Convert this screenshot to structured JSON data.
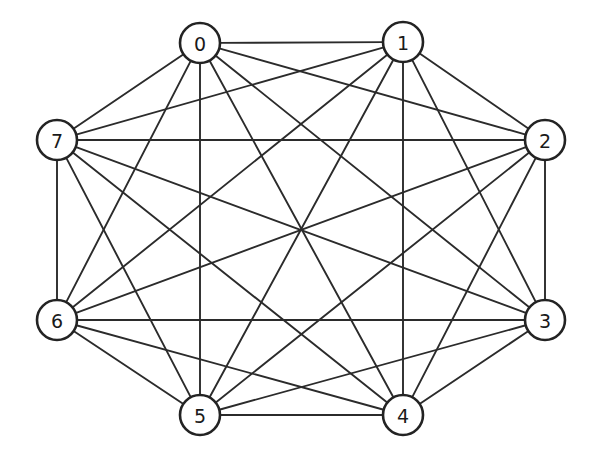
{
  "figure": {
    "graph_type": "complete-graph",
    "background_color": "#ffffff",
    "edge_color": "#2b2b2b",
    "node_fill_color": "#ffffff",
    "node_stroke_color": "#232323",
    "label_color": "#1a1a1a",
    "node_count": 8,
    "edge_count": 28
  },
  "nodes": [
    {
      "id": 0,
      "label": "0",
      "cx": 200,
      "cy": 43,
      "r": 20
    },
    {
      "id": 1,
      "label": "1",
      "cx": 403,
      "cy": 42,
      "r": 20
    },
    {
      "id": 2,
      "label": "2",
      "cx": 545,
      "cy": 140,
      "r": 20
    },
    {
      "id": 3,
      "label": "3",
      "cx": 545,
      "cy": 320,
      "r": 20
    },
    {
      "id": 4,
      "label": "4",
      "cx": 403,
      "cy": 415,
      "r": 20
    },
    {
      "id": 5,
      "label": "5",
      "cx": 200,
      "cy": 415,
      "r": 20
    },
    {
      "id": 6,
      "label": "6",
      "cx": 57,
      "cy": 320,
      "r": 20
    },
    {
      "id": 7,
      "label": "7",
      "cx": 57,
      "cy": 140,
      "r": 20
    }
  ],
  "edges": [
    {
      "source": 0,
      "target": 1
    },
    {
      "source": 0,
      "target": 2
    },
    {
      "source": 0,
      "target": 3
    },
    {
      "source": 0,
      "target": 4
    },
    {
      "source": 0,
      "target": 5
    },
    {
      "source": 0,
      "target": 6
    },
    {
      "source": 0,
      "target": 7
    },
    {
      "source": 1,
      "target": 2
    },
    {
      "source": 1,
      "target": 3
    },
    {
      "source": 1,
      "target": 4
    },
    {
      "source": 1,
      "target": 5
    },
    {
      "source": 1,
      "target": 6
    },
    {
      "source": 1,
      "target": 7
    },
    {
      "source": 2,
      "target": 3
    },
    {
      "source": 2,
      "target": 4
    },
    {
      "source": 2,
      "target": 5
    },
    {
      "source": 2,
      "target": 6
    },
    {
      "source": 2,
      "target": 7
    },
    {
      "source": 3,
      "target": 4
    },
    {
      "source": 3,
      "target": 5
    },
    {
      "source": 3,
      "target": 6
    },
    {
      "source": 3,
      "target": 7
    },
    {
      "source": 4,
      "target": 5
    },
    {
      "source": 4,
      "target": 6
    },
    {
      "source": 4,
      "target": 7
    },
    {
      "source": 5,
      "target": 6
    },
    {
      "source": 5,
      "target": 7
    },
    {
      "source": 6,
      "target": 7
    }
  ]
}
